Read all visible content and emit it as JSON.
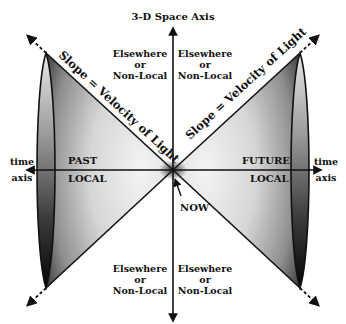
{
  "axes": {
    "space_axis_label": "3-D Space Axis",
    "time_axis_left": [
      "time",
      "axis"
    ],
    "time_axis_right": [
      "time",
      "axis"
    ]
  },
  "regions": {
    "past": {
      "top": "PAST",
      "bottom": "LOCAL"
    },
    "future": {
      "top": "FUTURE",
      "bottom": "LOCAL"
    },
    "elsewhere": {
      "line1": "Elsewhere",
      "line2": "or",
      "line3": "Non-Local"
    }
  },
  "slope_label": "Slope = Velocity of Light",
  "now_label": "NOW",
  "colors": {
    "line": "#111111",
    "cone_light": "#f2f2f2",
    "cone_mid": "#a8a8a8",
    "cone_dark": "#2a2a2a",
    "background": "#ffffff"
  }
}
